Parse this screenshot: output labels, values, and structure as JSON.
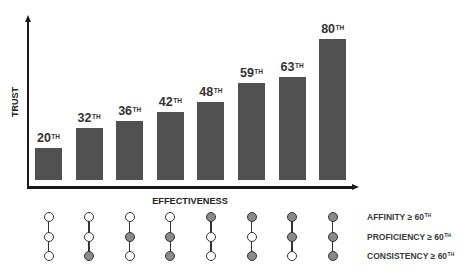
{
  "chart_data": {
    "type": "bar",
    "title": "",
    "xlabel": "EFFECTIVENESS",
    "ylabel": "TRUST",
    "values": [
      20,
      32,
      36,
      42,
      48,
      59,
      63,
      80
    ],
    "value_suffix": "TH",
    "bar_heights_px": [
      32,
      52,
      59,
      68,
      78,
      97,
      103,
      141
    ],
    "grid": false,
    "legend": null,
    "axis_ticks": false
  },
  "criteria": {
    "rows": [
      {
        "label": "AFFINITY ≥ 60",
        "sup": "TH"
      },
      {
        "label": "PROFICIENCY ≥ 60",
        "sup": "TH"
      },
      {
        "label": "CONSISTENCY ≥ 60",
        "sup": "TH"
      }
    ],
    "columns": [
      [
        false,
        false,
        false
      ],
      [
        false,
        false,
        true
      ],
      [
        false,
        true,
        false
      ],
      [
        false,
        true,
        true
      ],
      [
        true,
        false,
        false
      ],
      [
        true,
        false,
        true
      ],
      [
        true,
        true,
        false
      ],
      [
        true,
        true,
        true
      ]
    ]
  },
  "colors": {
    "bar": "#515151",
    "met": "#8a8a8a",
    "unmet": "#ffffff",
    "axis": "#1a1a1a",
    "text": "#333333"
  }
}
